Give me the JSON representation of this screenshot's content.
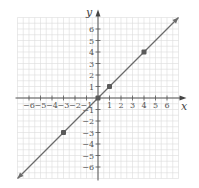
{
  "chart_data": {
    "type": "line",
    "title": "",
    "xlabel": "x",
    "ylabel": "y",
    "xlim": [
      -7,
      7
    ],
    "ylim": [
      -7,
      7
    ],
    "grid": true,
    "x_ticks": [
      -6,
      -5,
      -4,
      -3,
      -2,
      -1,
      1,
      2,
      3,
      4,
      5,
      6
    ],
    "y_ticks": [
      -6,
      -5,
      -4,
      -3,
      -2,
      -1,
      1,
      2,
      3,
      4,
      5,
      6
    ],
    "x_tick_labels": [
      "−6",
      "−5",
      "−4",
      "−3",
      "−2",
      "−1",
      "1",
      "2",
      "3",
      "4",
      "5",
      "6"
    ],
    "y_tick_labels": [
      "−6",
      "−5",
      "−4",
      "−3",
      "−2",
      "−1",
      "1",
      "2",
      "3",
      "4",
      "5",
      "6"
    ],
    "series": [
      {
        "name": "y = x",
        "line": {
          "x": [
            -7,
            7
          ],
          "y": [
            -7,
            7
          ]
        },
        "arrows": "both",
        "color": "#6b6b6b"
      }
    ],
    "points": [
      {
        "x": -3,
        "y": -3
      },
      {
        "x": 0,
        "y": 0
      },
      {
        "x": 1,
        "y": 1
      },
      {
        "x": 4,
        "y": 4
      }
    ],
    "point_color": "#5a5a5a",
    "axis_color": "#555555",
    "grid_color": "#dcdcdc"
  }
}
